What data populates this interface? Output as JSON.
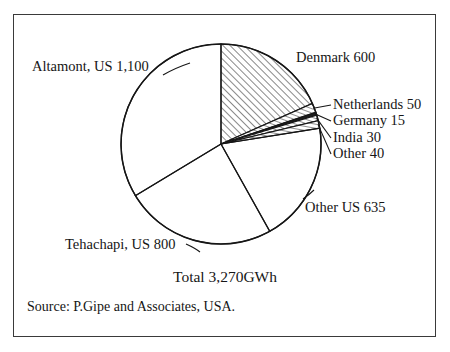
{
  "figure": {
    "frame_color": "#3a3a3a",
    "background": "#ffffff",
    "ink_color": "#161616"
  },
  "labels": {
    "altamont": "Altamont, US 1,100",
    "denmark": "Denmark 600",
    "netherlands": "Netherlands 50",
    "germany": "Germany 15",
    "india": "India 30",
    "other": "Other 40",
    "other_us": "Other US 635",
    "tehachapi": "Tehachapi, US 800",
    "total": "Total 3,270GWh",
    "source": "Source: P.Gipe and Associates, USA."
  },
  "chart_data": {
    "type": "pie",
    "title": "",
    "subtitle": "",
    "xlabel": "",
    "ylabel": "",
    "unit": "GWh",
    "total": 3270,
    "total_label": "Total 3,270GWh",
    "source": "Source: P.Gipe and Associates, USA.",
    "legend": "none",
    "grid": false,
    "start_angle_deg": 0,
    "direction": "clockwise",
    "center": {
      "x": 221,
      "y": 144
    },
    "radius": 100,
    "categories": [
      "Denmark",
      "Netherlands",
      "Germany",
      "India",
      "Other",
      "Other US",
      "Tehachapi, US",
      "Altamont, US"
    ],
    "values": [
      600,
      50,
      15,
      30,
      40,
      635,
      800,
      1100
    ],
    "slices": [
      {
        "name": "Denmark",
        "label": "Denmark 600",
        "value": 600,
        "percent": 18.3,
        "angle_deg": 66.06,
        "fill": "hatch-45",
        "leader": false
      },
      {
        "name": "Netherlands",
        "label": "Netherlands 50",
        "value": 50,
        "percent": 1.5,
        "angle_deg": 5.5,
        "fill": "hatch-vert",
        "leader": true
      },
      {
        "name": "Germany",
        "label": "Germany 15",
        "value": 15,
        "percent": 0.5,
        "angle_deg": 1.65,
        "fill": "solid",
        "leader": true
      },
      {
        "name": "India",
        "label": "India 30",
        "value": 30,
        "percent": 0.9,
        "angle_deg": 3.3,
        "fill": "hatch-vert",
        "leader": true
      },
      {
        "name": "Other",
        "label": "Other 40",
        "value": 40,
        "percent": 1.2,
        "angle_deg": 4.4,
        "fill": "hatch-horiz",
        "leader": true
      },
      {
        "name": "Other US",
        "label": "Other US 635",
        "value": 635,
        "percent": 19.4,
        "angle_deg": 69.91,
        "fill": "none",
        "leader": true
      },
      {
        "name": "Tehachapi, US",
        "label": "Tehachapi, US 800",
        "value": 800,
        "percent": 24.5,
        "angle_deg": 88.07,
        "fill": "none",
        "leader": true
      },
      {
        "name": "Altamont, US",
        "label": "Altamont, US 1,100",
        "value": 1100,
        "percent": 33.6,
        "angle_deg": 121.1,
        "fill": "none",
        "leader": false
      }
    ]
  }
}
